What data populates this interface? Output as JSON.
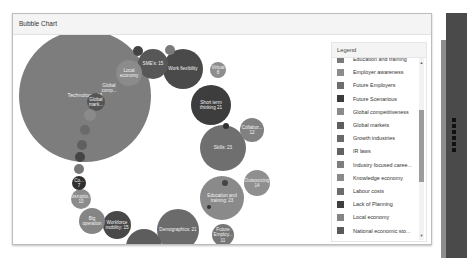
{
  "panel": {
    "title": "Bubble Chart"
  },
  "legend": {
    "title": "Legend",
    "items": [
      {
        "label": "Education and training",
        "color": "#7a7a7a"
      },
      {
        "label": "Employer awareness",
        "color": "#8c8c8c"
      },
      {
        "label": "Future Employers",
        "color": "#6e6e6e"
      },
      {
        "label": "Future Scenarious",
        "color": "#3c3c3c"
      },
      {
        "label": "Global competitiveness",
        "color": "#8a8a8a"
      },
      {
        "label": "Global markets",
        "color": "#5e5e5e"
      },
      {
        "label": "Growth industries",
        "color": "#6a6a6a"
      },
      {
        "label": "IR laws",
        "color": "#626262"
      },
      {
        "label": "Industry focused caree...",
        "color": "#7e7e7e"
      },
      {
        "label": "Knowledge economy",
        "color": "#8a8a8a"
      },
      {
        "label": "Labour costs",
        "color": "#6c6c6c"
      },
      {
        "label": "Lack of Planning",
        "color": "#3f3f3f"
      },
      {
        "label": "Local economy",
        "color": "#858585"
      },
      {
        "label": "National economic sto...",
        "color": "#5a5a5a"
      }
    ],
    "scroll_up_icon": "▲",
    "scroll_down_icon": "▼"
  },
  "chart_data": {
    "type": "bubble",
    "title": "Bubble Chart",
    "legend_position": "right",
    "bubbles": [
      {
        "label": "Technology",
        "value": 68
      },
      {
        "label": "Short term thinking",
        "value": 21
      },
      {
        "label": "Skills",
        "value": 23
      },
      {
        "label": "Education and training",
        "value": 23
      },
      {
        "label": "Demographics",
        "value": 21
      },
      {
        "label": "Work flexibility",
        "value": null
      },
      {
        "label": "SME's",
        "value": 15
      },
      {
        "label": "Automation",
        "value": 18
      },
      {
        "label": "Workforce mobility",
        "value": 15
      },
      {
        "label": "Local economy",
        "value": null
      },
      {
        "label": "Outsourcing",
        "value": 14
      },
      {
        "label": "Collabor...",
        "value": 12
      },
      {
        "label": "Future Employ...",
        "value": 11
      },
      {
        "label": "Big operation",
        "value": null
      },
      {
        "label": "Disruptio...",
        "value": 10
      },
      {
        "label": "Global comp...",
        "value": null
      },
      {
        "label": "Global mark...",
        "value": null
      },
      {
        "label": "Virtual",
        "value": 8
      },
      {
        "label": "Inter...",
        "value": 8
      },
      {
        "label": "Co...",
        "value": 7
      }
    ]
  },
  "bubbles_render": [
    {
      "text": "Technology: 68",
      "x": 72,
      "y": 61,
      "r": 66,
      "color": "#7d7d7d"
    },
    {
      "text": "Short term thinking 21",
      "x": 198,
      "y": 70,
      "r": 20,
      "color": "#3d3d3d"
    },
    {
      "text": "Skills: 23",
      "x": 210,
      "y": 113,
      "r": 23,
      "color": "#6f6f6f"
    },
    {
      "text": "Education and training: 23",
      "x": 209,
      "y": 163,
      "r": 22,
      "color": "#8a8a8a"
    },
    {
      "text": "Demographics: 21",
      "x": 165,
      "y": 195,
      "r": 21,
      "color": "#6b6b6b"
    },
    {
      "text": "Work flexibility",
      "x": 170,
      "y": 34,
      "r": 20,
      "color": "#4a4a4a"
    },
    {
      "text": "SME's: 15",
      "x": 140,
      "y": 29,
      "r": 15,
      "color": "#575757"
    },
    {
      "text": "Automation: 18",
      "x": 131,
      "y": 212,
      "r": 18,
      "color": "#5d5d5d"
    },
    {
      "text": "Workforce mobility: 15",
      "x": 104,
      "y": 190,
      "r": 14,
      "color": "#484848"
    },
    {
      "text": "Local economy",
      "x": 116,
      "y": 38,
      "r": 13,
      "color": "#8b8b8b"
    },
    {
      "text": "Outsourcing 14",
      "x": 244,
      "y": 148,
      "r": 13,
      "color": "#8f8f8f"
    },
    {
      "text": "Collabor... 12",
      "x": 239,
      "y": 95,
      "r": 12,
      "color": "#818181"
    },
    {
      "text": "Future Employ... 11",
      "x": 210,
      "y": 200,
      "r": 11,
      "color": "#767676"
    },
    {
      "text": "Big operation",
      "x": 79,
      "y": 186,
      "r": 13,
      "color": "#858585"
    },
    {
      "text": "Disruptio... 10",
      "x": 68,
      "y": 164,
      "r": 10,
      "color": "#8c8c8c"
    },
    {
      "text": "Global comp...",
      "x": 96,
      "y": 53,
      "r": 9,
      "color": "#7e7e7e"
    },
    {
      "text": "Global mark...",
      "x": 83,
      "y": 67,
      "r": 9,
      "color": "#555555"
    },
    {
      "text": "Virtual 8",
      "x": 205,
      "y": 35,
      "r": 8,
      "color": "#8e8e8e"
    },
    {
      "text": "Inter... 8",
      "x": 157,
      "y": 225,
      "r": 8,
      "color": "#3a3a3a"
    },
    {
      "text": "Co... 7",
      "x": 66,
      "y": 148,
      "r": 7,
      "color": "#2f2f2f"
    },
    {
      "text": "",
      "x": 77,
      "y": 80,
      "r": 6,
      "color": "#8a8a8a"
    },
    {
      "text": "",
      "x": 72,
      "y": 95,
      "r": 5,
      "color": "#6a6a6a"
    },
    {
      "text": "",
      "x": 69,
      "y": 110,
      "r": 5,
      "color": "#606060"
    },
    {
      "text": "",
      "x": 67,
      "y": 122,
      "r": 5,
      "color": "#444444"
    },
    {
      "text": "",
      "x": 66,
      "y": 134,
      "r": 5,
      "color": "#777777"
    },
    {
      "text": "",
      "x": 125,
      "y": 16,
      "r": 5,
      "color": "#444444"
    },
    {
      "text": "",
      "x": 157,
      "y": 15,
      "r": 5,
      "color": "#7a7a7a"
    },
    {
      "text": "",
      "x": 124,
      "y": 224,
      "r": 5,
      "color": "#5a5a5a"
    },
    {
      "text": "",
      "x": 213,
      "y": 91,
      "r": 3,
      "color": "#333333"
    },
    {
      "text": "",
      "x": 212,
      "y": 148,
      "r": 3,
      "color": "#444444"
    },
    {
      "text": "",
      "x": 196,
      "y": 172,
      "r": 2,
      "color": "#333333"
    }
  ]
}
